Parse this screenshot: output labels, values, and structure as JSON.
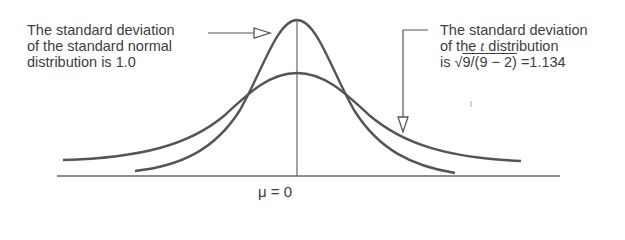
{
  "annotations": {
    "left": {
      "line1": "The standard deviation",
      "line2": "of the standard normal",
      "line3": "distribution is 1.0"
    },
    "right": {
      "line1": "The standard deviation",
      "line2_prefix": "of the ",
      "line2_var": "t",
      "line2_suffix": " distribution",
      "line3_prefix": "is ",
      "line3_sqrt_symbol": "√",
      "line3_radicand": "9/(9 − 2)",
      "line3_suffix": " =1.134"
    }
  },
  "axis": {
    "center_label": "μ = 0"
  },
  "curves": [
    {
      "name": "standard normal",
      "sd": 1.0
    },
    {
      "name": "t distribution",
      "sd": 1.134
    }
  ],
  "colors": {
    "stroke": "#555555",
    "text": "#3d3d3d"
  }
}
